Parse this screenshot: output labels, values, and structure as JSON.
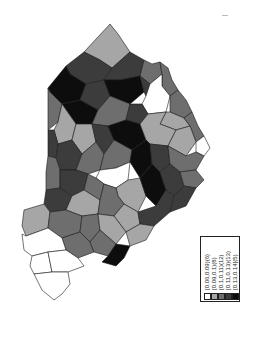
{
  "map": {
    "type": "choropleth",
    "orientation": "rotated 90 degrees",
    "classes": [
      {
        "label": "[0.06,0.09)(6)",
        "color": "#ffffff"
      },
      {
        "label": "[0.09,0.1)(8)",
        "color": "#a6a6a6"
      },
      {
        "label": "[0.1,0.11)(12)",
        "color": "#6e6e6e"
      },
      {
        "label": "[0.11,0.13)(13)",
        "color": "#3c3c3c"
      },
      {
        "label": "[0.13,0.14](5)",
        "color": "#0d0d0d"
      }
    ]
  },
  "legend": {
    "items": [
      {
        "label": "[0.06,0.09)(6)",
        "color": "#ffffff"
      },
      {
        "label": "[0.09,0.1)(8)",
        "color": "#a6a6a6"
      },
      {
        "label": "[0.1,0.11)(12)",
        "color": "#6e6e6e"
      },
      {
        "label": "[0.11,0.13)(13)",
        "color": "#3c3c3c"
      },
      {
        "label": "[0.13,0.14](5)",
        "color": "#0d0d0d"
      }
    ]
  }
}
